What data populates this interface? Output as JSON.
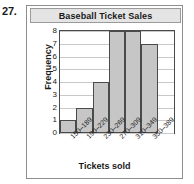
{
  "exercise": {
    "number": "27."
  },
  "chart_data": {
    "type": "bar",
    "title": "Baseball Ticket Sales",
    "xlabel": "Tickets sold",
    "ylabel": "Frequency",
    "categories": [
      "150–189",
      "190–229",
      "230–269",
      "270–309",
      "310–349",
      "350–389"
    ],
    "values": [
      1,
      2,
      4,
      8,
      8,
      7
    ],
    "yticks": [
      "8",
      "7",
      "6",
      "5",
      "4",
      "3",
      "2",
      "1",
      "0"
    ],
    "ylim": [
      0,
      8
    ],
    "grid": true,
    "legend": false,
    "bar_fill": "#c6c6c6",
    "bar_border": "#4a4a4a",
    "title_bar_fill": "#e4e4e4"
  }
}
